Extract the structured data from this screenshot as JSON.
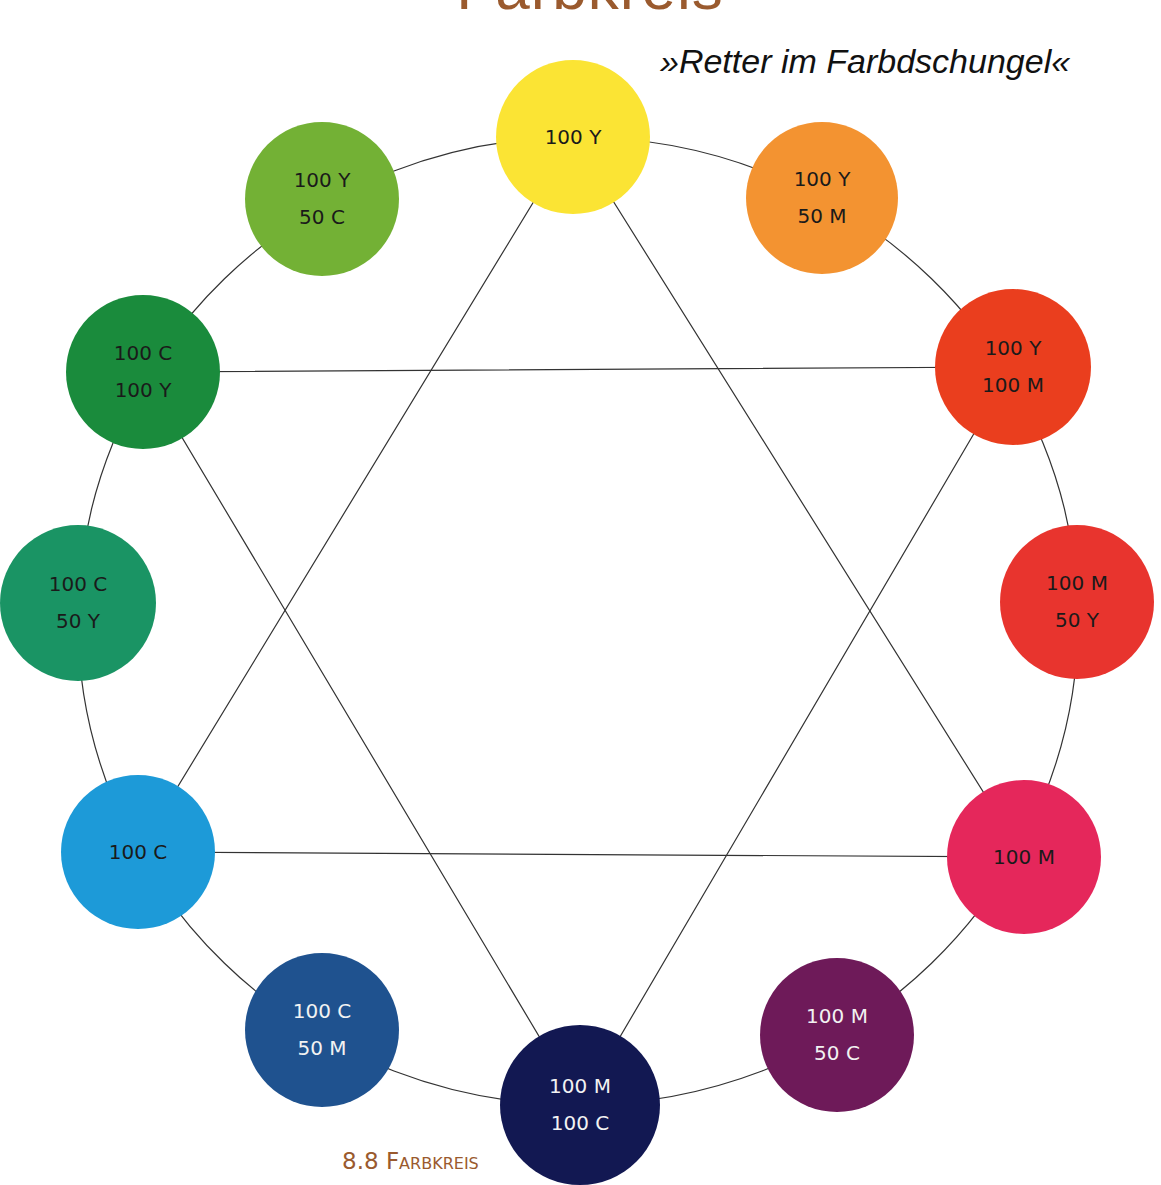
{
  "header": {
    "title": "Farbkreis",
    "subtitle": "»Retter im Farbdschungel«"
  },
  "caption": "8.8 Farbkreis",
  "colors": {
    "line": "#333333",
    "title": "#9a5a2e"
  },
  "swatches": [
    {
      "id": "y100",
      "line1": "100 Y",
      "line2": "",
      "cx": 573,
      "cy": 137,
      "r": 77,
      "fill": "#fbe434",
      "text": "#1a1a1a"
    },
    {
      "id": "y100-m50",
      "line1": "100 Y",
      "line2": "50 M",
      "cx": 822,
      "cy": 198,
      "r": 76,
      "fill": "#f39331",
      "text": "#1a1a1a"
    },
    {
      "id": "y100-m100",
      "line1": "100 Y",
      "line2": "100 M",
      "cx": 1013,
      "cy": 367,
      "r": 78,
      "fill": "#ea3e1e",
      "text": "#1a1a1a"
    },
    {
      "id": "m100-y50",
      "line1": "100 M",
      "line2": "50 Y",
      "cx": 1077,
      "cy": 602,
      "r": 77,
      "fill": "#e8342e",
      "text": "#1a1a1a"
    },
    {
      "id": "m100",
      "line1": "100 M",
      "line2": "",
      "cx": 1024,
      "cy": 857,
      "r": 77,
      "fill": "#e5275b",
      "text": "#1a1a1a"
    },
    {
      "id": "m100-c50",
      "line1": "100 M",
      "line2": "50 C",
      "cx": 837,
      "cy": 1035,
      "r": 77,
      "fill": "#6e1a59",
      "text": "#f2f2f2"
    },
    {
      "id": "m100-c100",
      "line1": "100 M",
      "line2": "100 C",
      "cx": 580,
      "cy": 1105,
      "r": 80,
      "fill": "#121852",
      "text": "#f2f2f2"
    },
    {
      "id": "c100-m50",
      "line1": "100 C",
      "line2": "50 M",
      "cx": 322,
      "cy": 1030,
      "r": 77,
      "fill": "#1f528f",
      "text": "#f2f2f2"
    },
    {
      "id": "c100",
      "line1": "100 C",
      "line2": "",
      "cx": 138,
      "cy": 852,
      "r": 77,
      "fill": "#1d9ad8",
      "text": "#1a1a1a"
    },
    {
      "id": "c100-y50",
      "line1": "100 C",
      "line2": "50 Y",
      "cx": 78,
      "cy": 603,
      "r": 78,
      "fill": "#1a9464",
      "text": "#1a1a1a"
    },
    {
      "id": "c100-y100",
      "line1": "100 C",
      "line2": "100 Y",
      "cx": 143,
      "cy": 372,
      "r": 77,
      "fill": "#1a8b3c",
      "text": "#1a1a1a"
    },
    {
      "id": "y100-c50",
      "line1": "100 Y",
      "line2": "50 C",
      "cx": 322,
      "cy": 199,
      "r": 77,
      "fill": "#73b135",
      "text": "#1a1a1a"
    }
  ],
  "triangles": [
    {
      "name": "primary-triangle",
      "points": "573,137 1024,857 138,852"
    },
    {
      "name": "secondary-triangle",
      "points": "1013,367 580,1105 143,372"
    }
  ],
  "ring": {
    "cx": 578,
    "cy": 621,
    "rx": 500,
    "ry": 484
  }
}
